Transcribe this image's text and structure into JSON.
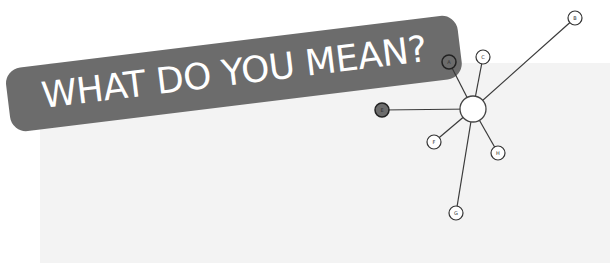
{
  "banner": {
    "title": "WHAT DO YOU MEAN?"
  },
  "colors": {
    "background": "#ffffff",
    "card": "#f3f3f3",
    "banner": "#6c6c6c",
    "banner_text": "#ffffff",
    "line": "#3a3a3a"
  },
  "network": {
    "hub": {
      "id": "hub",
      "label": ""
    },
    "nodes": [
      {
        "id": "A",
        "label": "A",
        "style": "dark"
      },
      {
        "id": "B",
        "label": "B",
        "style": "light"
      },
      {
        "id": "C",
        "label": "C",
        "style": "light"
      },
      {
        "id": "E",
        "label": "E",
        "style": "dark"
      },
      {
        "id": "F",
        "label": "F",
        "style": "light"
      },
      {
        "id": "G",
        "label": "G",
        "style": "light"
      },
      {
        "id": "H",
        "label": "H",
        "style": "light"
      }
    ]
  }
}
